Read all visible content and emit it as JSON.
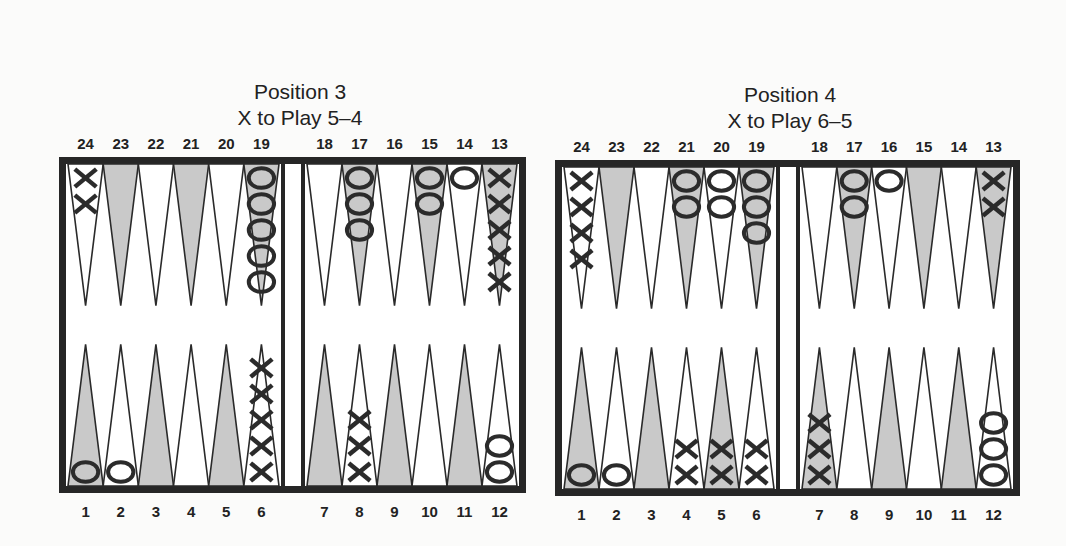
{
  "colors": {
    "frame": "#262626",
    "board_bg": "#ffffff",
    "point_light": "#ffffff",
    "point_dark": "#c9c9c9",
    "point_stroke": "#2a2a2a",
    "checker": "#2b2b2b"
  },
  "positions": [
    {
      "title": "Position 3",
      "subtitle": "X to Play 5–4",
      "dice": [
        5,
        4
      ],
      "player_to_move": "X",
      "top_labels": [
        "24",
        "23",
        "22",
        "21",
        "20",
        "19",
        "18",
        "17",
        "16",
        "15",
        "14",
        "13"
      ],
      "bottom_labels": [
        "1",
        "2",
        "3",
        "4",
        "5",
        "6",
        "7",
        "8",
        "9",
        "10",
        "11",
        "12"
      ],
      "checkers": {
        "1": {
          "player": "O",
          "count": 1
        },
        "2": {
          "player": "O",
          "count": 1
        },
        "6": {
          "player": "X",
          "count": 5
        },
        "8": {
          "player": "X",
          "count": 3
        },
        "12": {
          "player": "O",
          "count": 2
        },
        "13": {
          "player": "X",
          "count": 5
        },
        "14": {
          "player": "O",
          "count": 1
        },
        "15": {
          "player": "O",
          "count": 2
        },
        "17": {
          "player": "O",
          "count": 3
        },
        "19": {
          "player": "O",
          "count": 5
        },
        "24": {
          "player": "X",
          "count": 2
        }
      }
    },
    {
      "title": "Position 4",
      "subtitle": "X to Play 6–5",
      "dice": [
        6,
        5
      ],
      "player_to_move": "X",
      "top_labels": [
        "24",
        "23",
        "22",
        "21",
        "20",
        "19",
        "18",
        "17",
        "16",
        "15",
        "14",
        "13"
      ],
      "bottom_labels": [
        "1",
        "2",
        "3",
        "4",
        "5",
        "6",
        "7",
        "8",
        "9",
        "10",
        "11",
        "12"
      ],
      "checkers": {
        "1": {
          "player": "O",
          "count": 1
        },
        "2": {
          "player": "O",
          "count": 1
        },
        "4": {
          "player": "X",
          "count": 2
        },
        "5": {
          "player": "X",
          "count": 2
        },
        "6": {
          "player": "X",
          "count": 2
        },
        "7": {
          "player": "X",
          "count": 3
        },
        "12": {
          "player": "O",
          "count": 3
        },
        "13": {
          "player": "X",
          "count": 2
        },
        "16": {
          "player": "O",
          "count": 1
        },
        "17": {
          "player": "O",
          "count": 2
        },
        "19": {
          "player": "O",
          "count": 3
        },
        "20": {
          "player": "O",
          "count": 2
        },
        "21": {
          "player": "O",
          "count": 2
        },
        "24": {
          "player": "X",
          "count": 4
        }
      }
    }
  ]
}
